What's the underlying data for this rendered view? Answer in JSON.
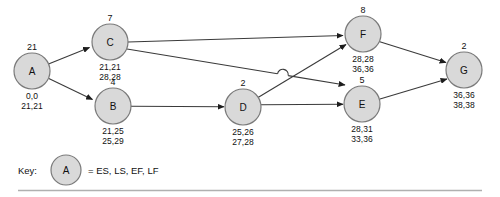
{
  "diagram": {
    "type": "activity-on-node-network",
    "colors": {
      "node_fill": "#d9d9d9",
      "node_stroke": "#7a7a7a",
      "edge": "#3a3a3a",
      "rule": "#b0b0b0",
      "background": "#ffffff"
    },
    "nodes": [
      {
        "id": "A",
        "label": "A",
        "duration": "21",
        "times_top": "0,0",
        "times_bottom": "21,21",
        "cx": 32,
        "cy": 71,
        "r": 18
      },
      {
        "id": "B",
        "label": "B",
        "duration": "4",
        "times_top": "21,25",
        "times_bottom": "25,29",
        "cx": 113,
        "cy": 106,
        "r": 18
      },
      {
        "id": "C",
        "label": "C",
        "duration": "7",
        "times_top": "21,21",
        "times_bottom": "28,28",
        "cx": 110,
        "cy": 42,
        "r": 18
      },
      {
        "id": "D",
        "label": "D",
        "duration": "2",
        "times_top": "25,26",
        "times_bottom": "27,28",
        "cx": 243,
        "cy": 107,
        "r": 18
      },
      {
        "id": "E",
        "label": "E",
        "duration": "5",
        "times_top": "28,31",
        "times_bottom": "33,36",
        "cx": 362,
        "cy": 104,
        "r": 18
      },
      {
        "id": "F",
        "label": "F",
        "duration": "8",
        "times_top": "28,28",
        "times_bottom": "36,36",
        "cx": 363,
        "cy": 34,
        "r": 18
      },
      {
        "id": "G",
        "label": "G",
        "duration": "2",
        "times_top": "36,36",
        "times_bottom": "38,38",
        "cx": 464,
        "cy": 70,
        "r": 18
      }
    ],
    "edges": [
      {
        "from": "A",
        "to": "C"
      },
      {
        "from": "A",
        "to": "B"
      },
      {
        "from": "C",
        "to": "F"
      },
      {
        "from": "C",
        "to": "E"
      },
      {
        "from": "B",
        "to": "D"
      },
      {
        "from": "D",
        "to": "F"
      },
      {
        "from": "D",
        "to": "E"
      },
      {
        "from": "F",
        "to": "G"
      },
      {
        "from": "E",
        "to": "G"
      }
    ]
  },
  "key": {
    "label": "Key:",
    "node_letter": "A",
    "equals_text": "= ES, LS, EF, LF"
  }
}
